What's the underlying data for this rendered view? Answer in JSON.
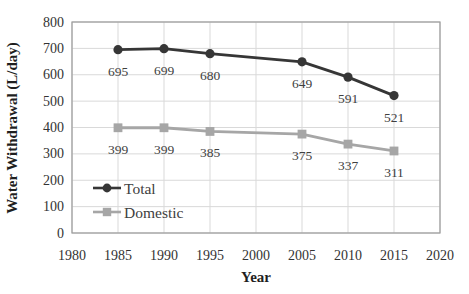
{
  "chart_data": {
    "type": "line",
    "title": "",
    "xlabel": "Year",
    "ylabel": "Water Withdrawal (L/day)",
    "xlim": [
      1980,
      2020
    ],
    "ylim": [
      0,
      800
    ],
    "x_ticks": [
      1980,
      1985,
      1990,
      1995,
      2000,
      2005,
      2010,
      2015,
      2020
    ],
    "y_ticks": [
      0,
      100,
      200,
      300,
      400,
      500,
      600,
      700,
      800
    ],
    "grid": true,
    "legend_position": "inside-bottom-left",
    "x": [
      1985,
      1990,
      1995,
      2005,
      2010,
      2015
    ],
    "series": [
      {
        "name": "Total",
        "values": [
          695,
          699,
          680,
          649,
          591,
          521
        ],
        "color": "#363636",
        "marker": "circle",
        "data_labels": [
          "695",
          "699",
          "680",
          "649",
          "591",
          "521"
        ]
      },
      {
        "name": "Domestic",
        "values": [
          399,
          399,
          385,
          375,
          337,
          311
        ],
        "color": "#a6a6a6",
        "marker": "square",
        "data_labels": [
          "399",
          "399",
          "385",
          "375",
          "337",
          "311"
        ]
      }
    ],
    "colors": {
      "background": "#ffffff",
      "gridline": "#d9d9d9",
      "plot_border": "#9b9b9b",
      "tick_text": "#333333",
      "data_label_text": "#404040",
      "axis_title_text": "#1f1f1f"
    }
  }
}
